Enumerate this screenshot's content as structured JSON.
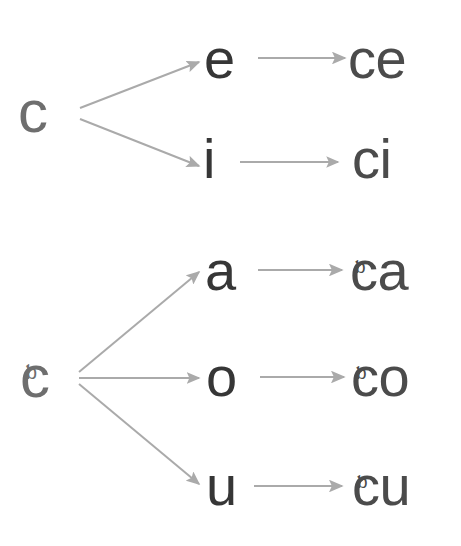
{
  "diagram": {
    "type": "branching-tree",
    "background_color": "#ffffff",
    "colors": {
      "source_letter": "#6e6e6e",
      "vowel_letter": "#363636",
      "result_letter": "#4b4b4b",
      "arrow": "#aaaaaa"
    },
    "groups": [
      {
        "id": "group-c",
        "source": {
          "label": "c",
          "base": "c",
          "cedilla": false,
          "x": 42,
          "y": 113
        },
        "branch_point": {
          "x": 77,
          "y": 113
        },
        "branches": [
          {
            "id": "c-e",
            "vowel": {
              "label": "e",
              "x": 222,
              "y": 60
            },
            "result": {
              "label": "ce",
              "base": "ce",
              "cedilla": false,
              "x": 385,
              "y": 60
            },
            "arrow_from_source": {
              "x1": 80,
              "y1": 108,
              "x2": 200,
              "y2": 62
            },
            "arrow_to_result": {
              "x1": 258,
              "y1": 58,
              "x2": 345,
              "y2": 58
            }
          },
          {
            "id": "c-i",
            "vowel": {
              "label": "i",
              "x": 209,
              "y": 160
            },
            "result": {
              "label": "ci",
              "base": "ci",
              "cedilla": false,
              "x": 382,
              "y": 160
            },
            "arrow_from_source": {
              "x1": 80,
              "y1": 119,
              "x2": 200,
              "y2": 166
            },
            "arrow_to_result": {
              "x1": 240,
              "y1": 162,
              "x2": 338,
              "y2": 162
            }
          }
        ]
      },
      {
        "id": "group-c-cedilla",
        "source": {
          "label": "ç",
          "base": "c",
          "cedilla": true,
          "x": 44,
          "y": 378
        },
        "branch_point": {
          "x": 76,
          "y": 378
        },
        "branches": [
          {
            "id": "cc-a",
            "vowel": {
              "label": "a",
              "x": 225,
              "y": 272
            },
            "result": {
              "label": "ça",
              "base": "ca",
              "cedilla": true,
              "x": 392,
              "y": 272
            },
            "arrow_from_source": {
              "x1": 79,
              "y1": 372,
              "x2": 200,
              "y2": 272
            },
            "arrow_to_result": {
              "x1": 258,
              "y1": 270,
              "x2": 342,
              "y2": 270
            }
          },
          {
            "id": "cc-o",
            "vowel": {
              "label": "o",
              "x": 226,
              "y": 378
            },
            "result": {
              "label": "ço",
              "base": "co",
              "cedilla": true,
              "x": 393,
              "y": 378
            },
            "arrow_from_source": {
              "x1": 79,
              "y1": 378,
              "x2": 200,
              "y2": 378
            },
            "arrow_to_result": {
              "x1": 260,
              "y1": 377,
              "x2": 344,
              "y2": 377
            }
          },
          {
            "id": "cc-u",
            "vowel": {
              "label": "u",
              "x": 226,
              "y": 487
            },
            "result": {
              "label": "çu",
              "base": "cu",
              "cedilla": true,
              "x": 394,
              "y": 487
            },
            "arrow_from_source": {
              "x1": 79,
              "y1": 384,
              "x2": 200,
              "y2": 484
            },
            "arrow_to_result": {
              "x1": 254,
              "y1": 486,
              "x2": 342,
              "y2": 486
            }
          }
        ]
      }
    ]
  }
}
